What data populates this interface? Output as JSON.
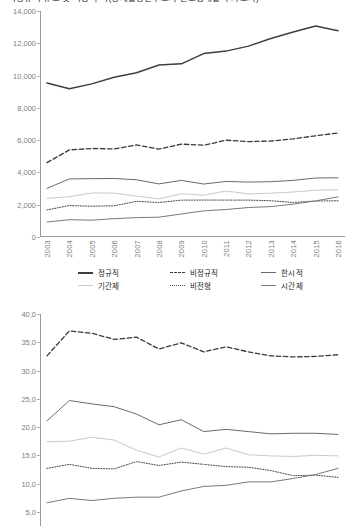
{
  "title": {
    "text": "비정규직 규모 및 비중 추이(경제활동인구조사 근로형태별 부가조사)"
  },
  "series_meta": [
    {
      "key": "regular",
      "label": "정규직",
      "color": "#3f3f3f",
      "style": "solid",
      "width": 1.5
    },
    {
      "key": "irregular",
      "label": "비정규직",
      "color": "#3a3a3a",
      "style": "dashed",
      "width": 1.3
    },
    {
      "key": "temporary",
      "label": "한시적",
      "color": "#6b6b6b",
      "style": "solid",
      "width": 1.0
    },
    {
      "key": "fixedterm",
      "label": "기간제",
      "color": "#c9c9c9",
      "style": "solid",
      "width": 1.0
    },
    {
      "key": "atypical",
      "label": "비전형",
      "color": "#4a4a4a",
      "style": "dotted",
      "width": 1.0
    },
    {
      "key": "parttime",
      "label": "시간제",
      "color": "#7a7a7a",
      "style": "solid",
      "width": 1.0
    }
  ],
  "legend": {
    "rows": [
      [
        "정규직",
        "비정규직",
        "한시적"
      ],
      [
        "기간제",
        "비전형",
        "시간제"
      ]
    ]
  },
  "chart_data": [
    {
      "type": "line",
      "title": "",
      "xlabel": "",
      "ylabel": "",
      "categories": [
        "2003",
        "2004",
        "2005",
        "2006",
        "2007",
        "2008",
        "2009",
        "2010",
        "2011",
        "2012",
        "2013",
        "2014",
        "2015",
        "2016"
      ],
      "ylim": [
        0,
        14000
      ],
      "yticks": [
        "0",
        "2,000",
        "4,000",
        "6,000",
        "8,000",
        "10,000",
        "12,000",
        "14,000"
      ],
      "ytick_values": [
        0,
        2000,
        4000,
        6000,
        8000,
        10000,
        12000,
        14000
      ],
      "grid": false,
      "legend_position": "bottom",
      "series": [
        {
          "name": "정규직",
          "key": "regular",
          "values": [
            9542,
            9190,
            9486,
            9894,
            10180,
            10658,
            10725,
            11362,
            11515,
            11823,
            12295,
            12699,
            13066,
            12781
          ]
        },
        {
          "name": "비정규직",
          "key": "irregular",
          "values": [
            4606,
            5394,
            5483,
            5457,
            5703,
            5445,
            5754,
            5685,
            5995,
            5911,
            5946,
            6077,
            6271,
            6444
          ]
        },
        {
          "name": "한시적",
          "key": "temporary",
          "values": [
            3013,
            3597,
            3615,
            3626,
            3546,
            3288,
            3507,
            3281,
            3442,
            3403,
            3427,
            3507,
            3655,
            3669
          ]
        },
        {
          "name": "기간제",
          "key": "fixedterm",
          "values": [
            2403,
            2490,
            2728,
            2722,
            2531,
            2365,
            2679,
            2589,
            2848,
            2673,
            2716,
            2786,
            2897,
            2930
          ]
        },
        {
          "name": "비전형",
          "key": "atypical",
          "values": [
            1678,
            1948,
            1907,
            1933,
            2208,
            2137,
            2283,
            2289,
            2285,
            2286,
            2246,
            2137,
            2229,
            2245
          ]
        },
        {
          "name": "시간제",
          "key": "parttime",
          "values": [
            929,
            1072,
            1044,
            1135,
            1201,
            1229,
            1426,
            1620,
            1702,
            1826,
            1883,
            2035,
            2236,
            2488
          ]
        }
      ]
    },
    {
      "type": "line",
      "title": "",
      "xlabel": "",
      "ylabel": "",
      "categories": [
        "2003",
        "2004",
        "2005",
        "2006",
        "2007",
        "2008",
        "2009",
        "2010",
        "2011",
        "2012",
        "2013",
        "2014",
        "2015",
        "2016"
      ],
      "ylim": [
        2.5,
        40.0
      ],
      "yticks": [
        "5,0",
        "10,0",
        "15,0",
        "20,0",
        "25,0",
        "30,0",
        "35,0",
        "40,0"
      ],
      "ytick_values": [
        5,
        10,
        15,
        20,
        25,
        30,
        35,
        40
      ],
      "grid": false,
      "legend_position": "bottom",
      "series": [
        {
          "name": "비정규직",
          "key": "irregular",
          "values": [
            32.6,
            37.0,
            36.6,
            35.5,
            35.9,
            33.8,
            34.9,
            33.3,
            34.2,
            33.3,
            32.6,
            32.4,
            32.5,
            32.8
          ]
        },
        {
          "name": "한시적",
          "key": "temporary",
          "values": [
            21.1,
            24.7,
            24.1,
            23.6,
            22.3,
            20.4,
            21.3,
            19.2,
            19.6,
            19.2,
            18.8,
            18.9,
            18.9,
            18.7
          ]
        },
        {
          "name": "기간제",
          "key": "fixedterm",
          "values": [
            17.4,
            17.5,
            18.2,
            17.7,
            15.9,
            14.7,
            16.3,
            15.2,
            16.3,
            15.1,
            14.9,
            14.8,
            15.0,
            14.9
          ]
        },
        {
          "name": "비전형",
          "key": "atypical",
          "values": [
            12.7,
            13.4,
            12.7,
            12.6,
            13.9,
            13.2,
            13.8,
            13.4,
            13.0,
            12.9,
            12.3,
            11.4,
            11.5,
            11.1
          ]
        },
        {
          "name": "시간제",
          "key": "parttime",
          "values": [
            6.6,
            7.4,
            7.0,
            7.4,
            7.6,
            7.6,
            8.7,
            9.5,
            9.7,
            10.3,
            10.3,
            10.9,
            11.6,
            12.7
          ]
        }
      ]
    }
  ]
}
